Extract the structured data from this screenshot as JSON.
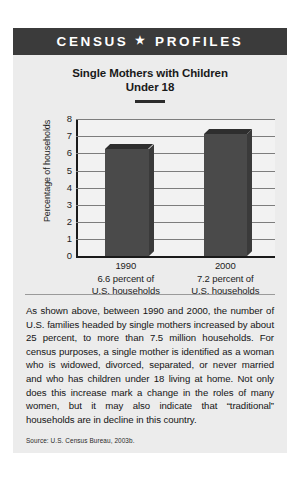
{
  "header": {
    "title_left": "CENSUS",
    "star": "★",
    "title_right": "PROFILES"
  },
  "chart_title": {
    "line1": "Single Mothers with Children",
    "line2": "Under 18"
  },
  "chart_data": {
    "type": "bar",
    "title": "Single Mothers with Children Under 18",
    "xlabel": "",
    "ylabel": "Percentage of households",
    "categories": [
      "1990",
      "2000"
    ],
    "values": [
      6.6,
      7.2
    ],
    "bar_top_visual": [
      6.25,
      7.1
    ],
    "category_sublabels": [
      [
        "6.6 percent of",
        "U.S. households"
      ],
      [
        "7.2 percent of",
        "U.S. households"
      ]
    ],
    "ylim": [
      0,
      8
    ],
    "yticks": [
      0,
      1,
      2,
      3,
      4,
      5,
      6,
      7,
      8
    ],
    "ytick_labels": [
      "0",
      "1",
      "2",
      "3",
      "4",
      "5",
      "6",
      "7",
      "8"
    ],
    "grid": true,
    "legend": "none",
    "bar_color": "#4a4a4a",
    "bar_top_color": "#2e2e2e",
    "bar_side_color": "#3a3a3a",
    "plot_bg": "#f2f2f2",
    "gridline_color": "#7d7d7d",
    "axis_color": "#1a1a1a"
  },
  "body": {
    "paragraph": "As shown above, between 1990 and 2000, the number of U.S. families headed by single mothers increased by about 25 percent, to more than 7.5 million households. For census purposes, a single mother is identified as a woman who is widowed, divorced, separated, or never married and who has children under 18 living at home. Not only does this increase mark a change in the roles of many women, but it may also indicate that “traditional” households are in decline in this country."
  },
  "source": {
    "text": "Source: U.S. Census Bureau, 2003b."
  },
  "colors": {
    "header_bg": "#3b3b3b",
    "card_bg": "#ececec",
    "page_bg": "#ffffff",
    "text": "#141414"
  }
}
